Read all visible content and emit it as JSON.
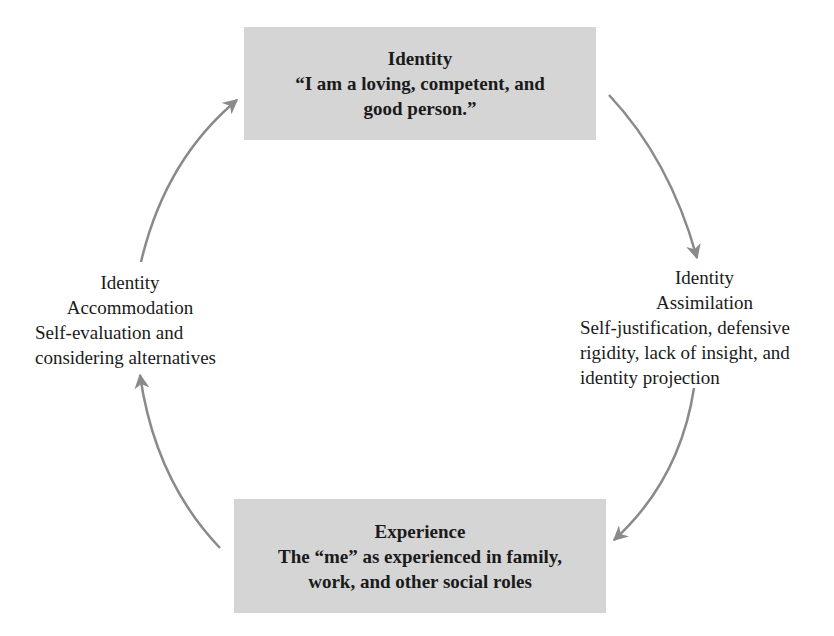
{
  "diagram": {
    "type": "cycle",
    "colors": {
      "box_fill": "#d5d5d5",
      "arrow": "#8a8a8a",
      "text": "#1a1a1a"
    },
    "top_box": {
      "title": "Identity",
      "lines": [
        "“I am a loving, competent, and",
        "good person.”"
      ]
    },
    "bottom_box": {
      "title": "Experience",
      "lines": [
        "The “me” as experienced in family,",
        "work, and other social roles"
      ]
    },
    "left_label": {
      "title": "Identity",
      "subtitle": "Accommodation",
      "lines": [
        "Self-evaluation and",
        "considering alternatives"
      ]
    },
    "right_label": {
      "title": "Identity",
      "subtitle": "Assimilation",
      "lines": [
        "Self-justification, defensive",
        "rigidity, lack of insight, and",
        "identity projection"
      ]
    },
    "arrows": [
      {
        "from": "top_box",
        "to": "right_label"
      },
      {
        "from": "right_label",
        "to": "bottom_box"
      },
      {
        "from": "bottom_box",
        "to": "left_label"
      },
      {
        "from": "left_label",
        "to": "top_box"
      }
    ]
  }
}
